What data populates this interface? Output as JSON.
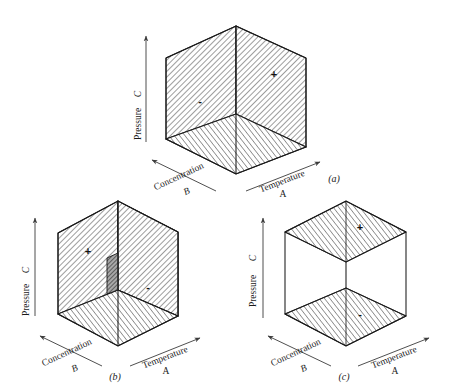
{
  "figure": {
    "stroke_color": "#1a1a1a",
    "hatch_color": "#2b2b2b",
    "background_color": "#ffffff",
    "dark_face_color": "#8a8a8a"
  },
  "axes": {
    "vertical_letter": "C",
    "vertical_name": "Pressure",
    "depth_name": "Concentration",
    "depth_letter": "B",
    "horizontal_name": "Temperature",
    "horizontal_letter": "A"
  },
  "panels": [
    {
      "id": "a",
      "caption": "(a)",
      "signs": [
        {
          "label": "-",
          "face": "left-back-face"
        },
        {
          "label": "+",
          "face": "right-face"
        }
      ],
      "shaded_faces": [
        "left-back-face",
        "right-face",
        "bottom-face"
      ]
    },
    {
      "id": "b",
      "caption": "(b)",
      "signs": [
        {
          "label": "+",
          "face": "left-back-face"
        },
        {
          "label": "-",
          "face": "right-face"
        }
      ],
      "shaded_faces": [
        "left-back-face",
        "right-face",
        "bottom-face",
        "center-column"
      ]
    },
    {
      "id": "c",
      "caption": "(c)",
      "signs": [
        {
          "label": "+",
          "face": "top-face"
        },
        {
          "label": "-",
          "face": "bottom-face"
        }
      ],
      "shaded_faces": [
        "top-face",
        "bottom-face"
      ]
    }
  ]
}
